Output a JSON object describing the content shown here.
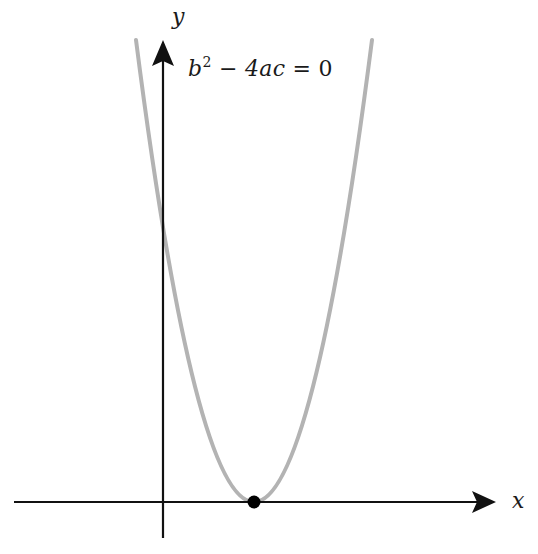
{
  "figure": {
    "axes": {
      "x_label": "x",
      "y_label": "y",
      "origin_px": [
        163,
        502
      ],
      "x_axis": {
        "from_px": 14,
        "to_px": 496,
        "y_px": 502
      },
      "y_axis": {
        "x_px": 163,
        "from_px": 538,
        "to_px": 40
      }
    },
    "equation": {
      "base": "b",
      "exponent": "2",
      "minus": " − ",
      "term": "4ac",
      "equals": " = 0"
    },
    "curve": {
      "type": "parabola",
      "opens": "up",
      "vertex_px": [
        254,
        502
      ],
      "y_intercept_px": 225,
      "color": "#b3b3b3"
    },
    "vertex_point": {
      "color": "#000000",
      "radius_px": 6
    },
    "axis_color": "#111111"
  }
}
